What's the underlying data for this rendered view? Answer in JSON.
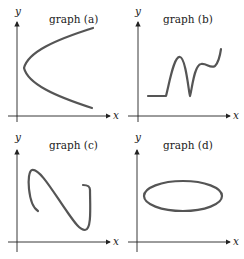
{
  "panels": [
    {
      "id": "a",
      "title": "graph (a)",
      "x_label": "x",
      "y_label": "y",
      "shape": "sideways parabola opening right"
    },
    {
      "id": "b",
      "title": "graph (b)",
      "x_label": "x",
      "y_label": "y",
      "shape": "flat then oscillating rising curve"
    },
    {
      "id": "c",
      "title": "graph (c)",
      "x_label": "x",
      "y_label": "y",
      "shape": "S-shaped curve failing vertical line test"
    },
    {
      "id": "d",
      "title": "graph (d)",
      "x_label": "x",
      "y_label": "y",
      "shape": "ellipse"
    }
  ],
  "colors": {
    "axis": "#222222",
    "curve": "#555555",
    "background": "#ffffff"
  }
}
